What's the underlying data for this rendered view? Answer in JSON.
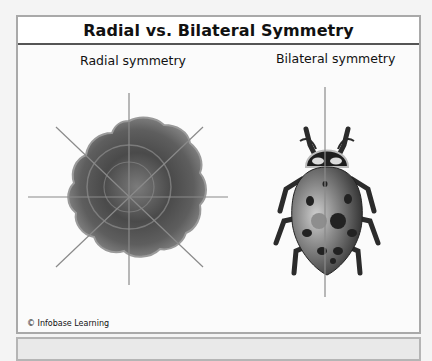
{
  "figure": {
    "title": "Radial vs. Bilateral Symmetry",
    "panels": [
      {
        "label": "Radial symmetry",
        "subject": "sea-star-like radial organism",
        "symmetry_lines": 4
      },
      {
        "label": "Bilateral symmetry",
        "subject": "ladybug",
        "symmetry_lines": 1
      }
    ],
    "credit": "© Infobase Learning"
  },
  "colors": {
    "frame_border": "#a9a9a9",
    "title_divider": "#555555",
    "organism": "#6f6f6f",
    "symmetry_line": "#8a8a8a"
  }
}
